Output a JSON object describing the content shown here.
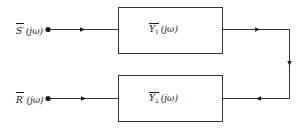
{
  "diagram": {
    "type": "block-diagram",
    "line_color": "#333333",
    "nodes": [
      {
        "id": "input_s",
        "kind": "terminal",
        "symbol": "S",
        "superscript": "'",
        "argument": "(jω)"
      },
      {
        "id": "block_y1",
        "kind": "block",
        "symbol": "Y",
        "subscript": "1",
        "argument": "(jω)"
      },
      {
        "id": "block_y2",
        "kind": "block",
        "symbol": "Y",
        "subscript": "2",
        "argument": "(jω)"
      },
      {
        "id": "input_r",
        "kind": "terminal",
        "symbol": "R",
        "superscript": "'",
        "argument": "(jω)"
      }
    ],
    "edges": [
      {
        "from": "input_s",
        "to": "block_y1",
        "direction": "right"
      },
      {
        "from": "block_y1",
        "to": "block_y2",
        "route": "right-down-left"
      },
      {
        "from": "block_y2",
        "to": "input_r",
        "direction": "left"
      }
    ]
  },
  "labels": {
    "input_s": {
      "symbol": "S",
      "prime": "'",
      "arg": "(jω)"
    },
    "input_r": {
      "symbol": "R",
      "prime": "'",
      "arg": "(jω)"
    },
    "block_y1": {
      "symbol": "Y",
      "sub": "1",
      "arg": "(jω)"
    },
    "block_y2": {
      "symbol": "Y",
      "sub": "2",
      "arg": "(jω)"
    }
  }
}
